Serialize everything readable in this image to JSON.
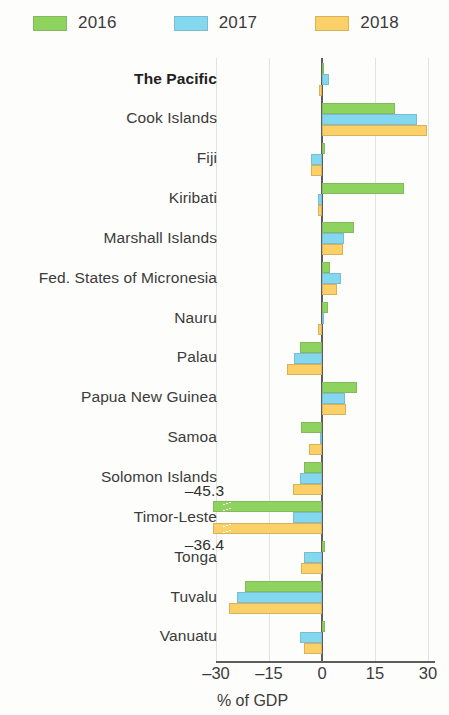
{
  "legend": {
    "items": [
      {
        "label": "2016",
        "color": "#8ed35e",
        "icon": "legend-swatch-2016"
      },
      {
        "label": "2017",
        "color": "#83d8f0",
        "icon": "legend-swatch-2017"
      },
      {
        "label": "2018",
        "color": "#fbd069",
        "icon": "legend-swatch-2018"
      }
    ]
  },
  "axis": {
    "xticks": [
      "–30",
      "–15",
      "0",
      "15",
      "30"
    ],
    "xlabel": "% of GDP"
  },
  "annotations": [
    {
      "text": "–45.3",
      "for": "Timor-Leste 2016"
    },
    {
      "text": "–36.4",
      "for": "Timor-Leste 2018"
    }
  ],
  "categories": [
    "The Pacific",
    "Cook Islands",
    "Fiji",
    "Kiribati",
    "Marshall Islands",
    "Fed. States of Micronesia",
    "Nauru",
    "Palau",
    "Papua New Guinea",
    "Samoa",
    "Solomon Islands",
    "Timor-Leste",
    "Tonga",
    "Tuvalu",
    "Vanuatu"
  ],
  "chart_data": {
    "type": "bar",
    "orientation": "horizontal",
    "title": "",
    "xlabel": "% of GDP",
    "ylabel": "",
    "xlim": [
      -30,
      30
    ],
    "xticks": [
      -30,
      -15,
      0,
      15,
      30
    ],
    "grid": true,
    "legend_position": "top-left",
    "categories": [
      "The Pacific",
      "Cook Islands",
      "Fiji",
      "Kiribati",
      "Marshall Islands",
      "Fed. States of Micronesia",
      "Nauru",
      "Palau",
      "Papua New Guinea",
      "Samoa",
      "Solomon Islands",
      "Timor-Leste",
      "Tonga",
      "Tuvalu",
      "Vanuatu"
    ],
    "series": [
      {
        "name": "2016",
        "color": "#8ed35e",
        "values": [
          0.6,
          20.8,
          0.8,
          23.3,
          9.0,
          2.3,
          1.6,
          -6.3,
          9.8,
          -6.0,
          -5.0,
          -45.3,
          0.8,
          -21.8,
          0.8
        ]
      },
      {
        "name": "2017",
        "color": "#83d8f0",
        "values": [
          2.0,
          27.0,
          -3.0,
          -1.0,
          6.2,
          5.4,
          0.0,
          -7.8,
          6.4,
          -0.6,
          -6.2,
          -8.3,
          -5.0,
          -24.0,
          -6.2
        ]
      },
      {
        "name": "2018",
        "color": "#fbd069",
        "values": [
          -0.8,
          29.7,
          -3.2,
          -1.2,
          6.0,
          4.2,
          -1.2,
          -9.8,
          6.8,
          -3.8,
          -8.2,
          -36.4,
          -6.0,
          -26.2,
          -5.0
        ]
      }
    ],
    "broken_bars": [
      {
        "category": "Timor-Leste",
        "series": "2016",
        "value": -45.3,
        "label": "–45.3"
      },
      {
        "category": "Timor-Leste",
        "series": "2018",
        "value": -36.4,
        "label": "–36.4"
      }
    ]
  }
}
